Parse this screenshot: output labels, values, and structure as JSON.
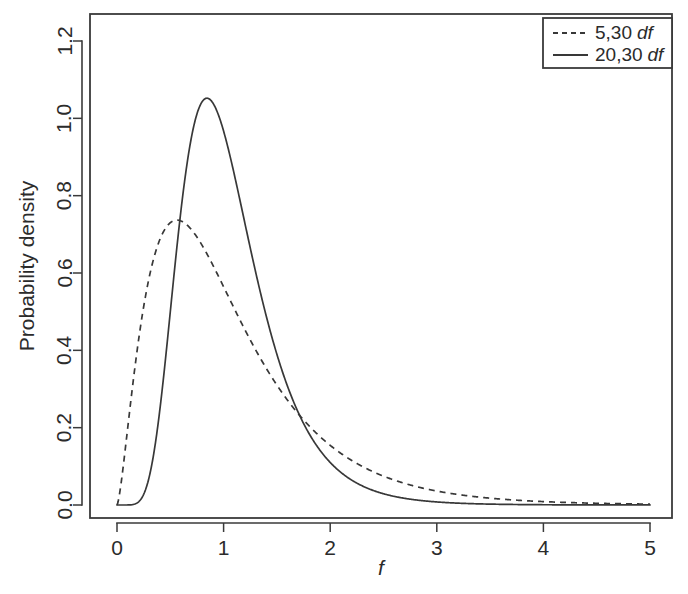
{
  "chart_data": {
    "type": "line",
    "title": "",
    "xlabel": "f",
    "ylabel": "Probability density",
    "xlim": [
      0,
      5
    ],
    "ylim": [
      0,
      1.28
    ],
    "xticks": [
      "0",
      "1",
      "2",
      "3",
      "4",
      "5"
    ],
    "xtick_values": [
      0,
      1,
      2,
      3,
      4,
      5
    ],
    "yticks": [
      "0.0",
      "0.2",
      "0.4",
      "0.6",
      "0.8",
      "1.0",
      "1.2"
    ],
    "ytick_values": [
      0.0,
      0.2,
      0.4,
      0.6,
      0.8,
      1.0,
      1.2
    ],
    "grid": false,
    "legend_position": "top-right",
    "series": [
      {
        "name": "5,30 df",
        "label_numbers": "5,30",
        "label_suffix": "df",
        "style": "dashed",
        "color": "#383838",
        "df1": 5,
        "df2": 30,
        "peak": {
          "x": 0.55,
          "y": 0.735
        },
        "x": [
          0.0,
          0.05,
          0.1,
          0.15,
          0.2,
          0.25,
          0.3,
          0.35,
          0.4,
          0.45,
          0.5,
          0.55,
          0.6,
          0.65,
          0.7,
          0.75,
          0.8,
          0.85,
          0.9,
          0.95,
          1.0,
          1.1,
          1.2,
          1.3,
          1.4,
          1.5,
          1.6,
          1.7,
          1.75,
          1.8,
          1.9,
          2.0,
          2.2,
          2.4,
          2.6,
          2.8,
          3.0,
          3.2,
          3.4,
          3.6,
          3.8,
          4.0,
          4.25,
          4.5,
          4.75,
          5.0
        ],
        "y": [
          0.0,
          0.1,
          0.27,
          0.41,
          0.52,
          0.6,
          0.66,
          0.7,
          0.72,
          0.733,
          0.735,
          0.734,
          0.727,
          0.715,
          0.7,
          0.682,
          0.662,
          0.64,
          0.617,
          0.594,
          0.57,
          0.521,
          0.473,
          0.427,
          0.384,
          0.344,
          0.307,
          0.273,
          0.258,
          0.243,
          0.216,
          0.191,
          0.149,
          0.116,
          0.09,
          0.07,
          0.054,
          0.042,
          0.033,
          0.026,
          0.021,
          0.017,
          0.013,
          0.011,
          0.009,
          0.008
        ]
      },
      {
        "name": "20,30 df",
        "label_numbers": "20,30",
        "label_suffix": "df",
        "style": "solid",
        "color": "#383838",
        "df1": 20,
        "df2": 30,
        "peak": {
          "x": 0.82,
          "y": 1.06
        },
        "x": [
          0.0,
          0.05,
          0.1,
          0.15,
          0.2,
          0.25,
          0.3,
          0.35,
          0.4,
          0.45,
          0.5,
          0.55,
          0.6,
          0.65,
          0.7,
          0.75,
          0.8,
          0.85,
          0.9,
          0.95,
          1.0,
          1.1,
          1.2,
          1.3,
          1.4,
          1.5,
          1.6,
          1.7,
          1.75,
          1.8,
          1.9,
          2.0,
          2.2,
          2.4,
          2.6,
          2.8,
          3.0,
          3.2,
          3.4,
          3.6,
          3.8,
          4.0,
          4.25,
          4.5,
          4.75,
          5.0
        ],
        "y": [
          0.0,
          0.0,
          0.001,
          0.005,
          0.019,
          0.049,
          0.1,
          0.172,
          0.262,
          0.362,
          0.464,
          0.562,
          0.65,
          0.726,
          0.79,
          0.84,
          0.878,
          0.903,
          0.918,
          0.923,
          0.92,
          0.894,
          0.848,
          0.789,
          0.722,
          0.652,
          0.581,
          0.513,
          0.48,
          0.449,
          0.39,
          0.337,
          0.247,
          0.178,
          0.127,
          0.09,
          0.064,
          0.045,
          0.032,
          0.023,
          0.017,
          0.012,
          0.008,
          0.005,
          0.004,
          0.003
        ]
      }
    ],
    "annotations": []
  },
  "legend": {
    "entries": [
      {
        "key": "dashed",
        "numbers": "5,30",
        "suffix": "df"
      },
      {
        "key": "solid",
        "numbers": "20,30",
        "suffix": "df"
      }
    ]
  },
  "axes": {
    "y_title": "Probability density",
    "x_title": "f",
    "x_tick_labels": [
      "0",
      "1",
      "2",
      "3",
      "4",
      "5"
    ],
    "y_tick_labels": [
      "0.0",
      "0.2",
      "0.4",
      "0.6",
      "0.8",
      "1.0",
      "1.2"
    ]
  },
  "colors": {
    "ink": "#383838",
    "axis": "#3a3a3a",
    "background": "#ffffff"
  }
}
